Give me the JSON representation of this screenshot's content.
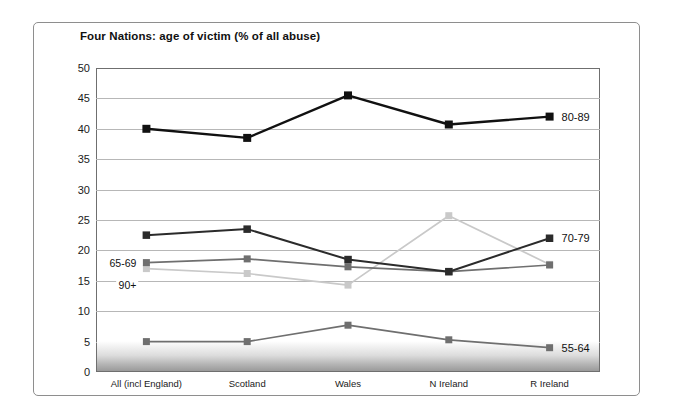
{
  "figure": {
    "title": "Four Nations: age of victim (% of all abuse)"
  },
  "chart_data": {
    "type": "line",
    "title": "Four Nations: age of victim (% of all abuse)",
    "xlabel": "",
    "ylabel": "",
    "ylim": [
      0,
      50
    ],
    "yticks": [
      0,
      5,
      10,
      15,
      20,
      25,
      30,
      35,
      40,
      45,
      50
    ],
    "grid": true,
    "legend_position": "inline-annotations",
    "categories": [
      "All (incl England)",
      "Scotland",
      "Wales",
      "N Ireland",
      "R Ireland"
    ],
    "series": [
      {
        "name": "80-89",
        "color": "#111111",
        "marker": "square",
        "label_position": "right",
        "values": [
          40.0,
          38.5,
          45.5,
          40.7,
          42.0
        ]
      },
      {
        "name": "70-79",
        "color": "#2b2b2b",
        "marker": "square",
        "label_position": "right",
        "values": [
          22.5,
          23.5,
          18.5,
          16.5,
          22.0
        ]
      },
      {
        "name": "65-69",
        "color": "#6f6f6f",
        "marker": "square",
        "label_position": "left-inline",
        "values": [
          18.0,
          18.6,
          17.3,
          16.5,
          17.6
        ]
      },
      {
        "name": "90+",
        "color": "#c9c9c9",
        "marker": "square",
        "label_position": "left-inline",
        "values": [
          17.0,
          16.2,
          14.3,
          25.7,
          17.7
        ]
      },
      {
        "name": "55-64",
        "color": "#6f6f6f",
        "marker": "square",
        "label_position": "right",
        "values": [
          5.0,
          5.0,
          7.7,
          5.3,
          4.0
        ]
      }
    ]
  }
}
